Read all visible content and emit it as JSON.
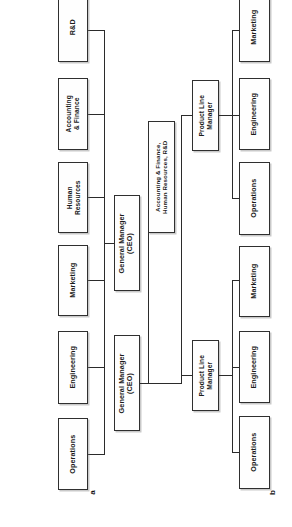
{
  "figure": {
    "orientation": "rotated-90-ccw",
    "background_color": "#ffffff",
    "line_color": "#2b2b2b",
    "box_border_color": "#2f2f2f",
    "diagrams": [
      {
        "key": "a",
        "caption": "a",
        "root": "General Manager (CEO)",
        "nodes": [
          "General Manager\n(CEO)",
          "Operations",
          "Engineering",
          "Marketing",
          "Human Resources",
          "Accounting & Finance",
          "R&D"
        ]
      },
      {
        "key": "b",
        "caption": "b",
        "root": "General Manager (CEO)",
        "nodes": [
          "General Manager\n(CEO)",
          "Accounting & Finance, Human Resources, R&D",
          "Product Line Manager",
          "Operations",
          "Engineering",
          "Marketing"
        ]
      }
    ]
  },
  "diagram_a": {
    "ceo": {
      "line1": "General Manager",
      "line2": "(CEO)"
    },
    "departments": [
      {
        "line1": "R&D",
        "line2": ""
      },
      {
        "line1": "Accounting",
        "line2": "& Finance"
      },
      {
        "line1": "Human",
        "line2": "Resources"
      },
      {
        "line1": "Marketing",
        "line2": ""
      },
      {
        "line1": "Engineering",
        "line2": ""
      },
      {
        "line1": "Operations",
        "line2": ""
      }
    ],
    "caption": "a"
  },
  "diagram_b": {
    "ceo": {
      "line1": "General Manager",
      "line2": "(CEO)"
    },
    "staff": {
      "line1": "Accounting & Finance,",
      "line2": "Human Resources, R&D"
    },
    "product_line_manager_top": {
      "line1": "Product Line",
      "line2": "Manager"
    },
    "product_line_manager_bottom": {
      "line1": "Product Line",
      "line2": "Manager"
    },
    "division_top": [
      {
        "line1": "Marketing",
        "line2": ""
      },
      {
        "line1": "Engineering",
        "line2": ""
      },
      {
        "line1": "Operations",
        "line2": ""
      }
    ],
    "division_bottom": [
      {
        "line1": "Marketing",
        "line2": ""
      },
      {
        "line1": "Engineering",
        "line2": ""
      },
      {
        "line1": "Operations",
        "line2": ""
      }
    ],
    "caption": "b"
  }
}
